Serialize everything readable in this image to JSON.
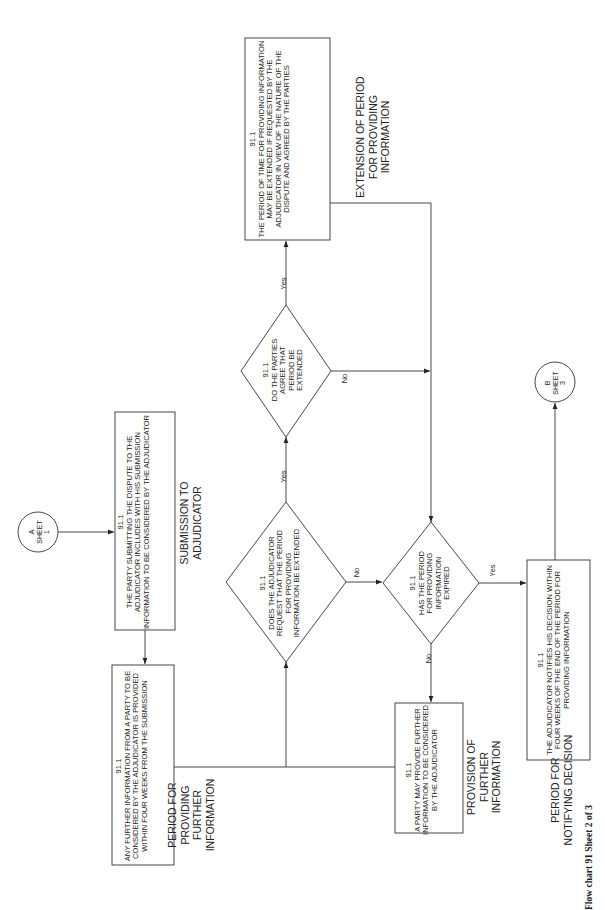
{
  "figure": {
    "caption": "Flow chart 91  Sheet 2 of 3",
    "orientation": "rotated 90 degrees counterclockwise"
  },
  "connectors": {
    "start": {
      "letter": "A",
      "sheet_label": "SHEET",
      "sheet": "1"
    },
    "end": {
      "letter": "B",
      "sheet_label": "SHEET",
      "sheet": "3"
    }
  },
  "nodes": {
    "submission": {
      "ref": "91.1",
      "text": "THE PARTY SUBMITTING THE DISPUTE TO THE ADJUDICATOR INCLUDES WITH HIS SUBMISSION INFORMATION TO BE CONSIDERED BY THE ADJUDICATOR",
      "caption": "SUBMISSION TO ADJUDICATOR"
    },
    "further_info_period": {
      "ref": "91.1",
      "text": "ANY FURTHER INFORMATION FROM A PARTY TO BE CONSIDERED BY THE ADJUDICATOR IS PROVIDED WITHIN FOUR WEEKS FROM THE SUBMISSION",
      "caption": "PERIOD FOR PROVIDING FURTHER INFORMATION"
    },
    "adjudicator_request": {
      "ref": "91.1",
      "text": "DOES THE ADJUDICATOR REQUEST THAT THE PERIOD FOR PROVIDING INFORMATION BE EXTENDED"
    },
    "parties_agree": {
      "ref": "91.1",
      "text": "DO THE PARTIES AGREE THAT PERIOD BE EXTENDED"
    },
    "extension": {
      "ref": "91.1",
      "text": "THE PERIOD OF TIME FOR PROVIDING INFORMATION MAY BE EXTENDED IF REQUESTED BY THE ADJUDICATOR IN VIEW OF THE NATURE OF THE DISPUTE AND AGREED BY THE PARTIES",
      "caption": "EXTENSION OF PERIOD FOR PROVIDING INFORMATION"
    },
    "period_expired": {
      "ref": "91.1",
      "text": "HAS THE PERIOD FOR PROVIDING INFORMATION EXPIRED"
    },
    "provision": {
      "ref": "91.1",
      "text": "A PARTY MAY PROVIDE FURTHER INFORMATION TO BE CONSIDERED BY THE ADJUDICATOR",
      "caption": "PROVISION OF FURTHER INFORMATION"
    },
    "notify_decision": {
      "ref": "91.1",
      "text": "THE ADJUDICATOR NOTIFIES HIS DECISION WITHIN FOUR WEEKS OF THE END OF THE PERIOD FOR PROVIDING INFORMATION",
      "caption": "PERIOD FOR NOTIFYING DECISION"
    }
  },
  "edge_labels": {
    "request_yes": "Yes",
    "request_no": "No",
    "agree_yes": "Yes",
    "agree_no": "No",
    "expired_yes": "Yes",
    "expired_no": "No"
  },
  "colors": {
    "line": "#333333",
    "text": "#222222",
    "background": "#ffffff"
  }
}
